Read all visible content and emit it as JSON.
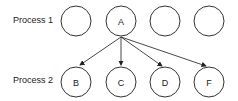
{
  "rows": [
    {
      "label": "Process 1",
      "nodes": [
        "",
        "A",
        "",
        ""
      ]
    },
    {
      "label": "Process 2",
      "nodes": [
        "B",
        "C",
        "D",
        "F"
      ]
    }
  ],
  "edges": [
    {
      "from": "A",
      "to": "B"
    },
    {
      "from": "A",
      "to": "C"
    },
    {
      "from": "A",
      "to": "D"
    },
    {
      "from": "A",
      "to": "F"
    }
  ]
}
